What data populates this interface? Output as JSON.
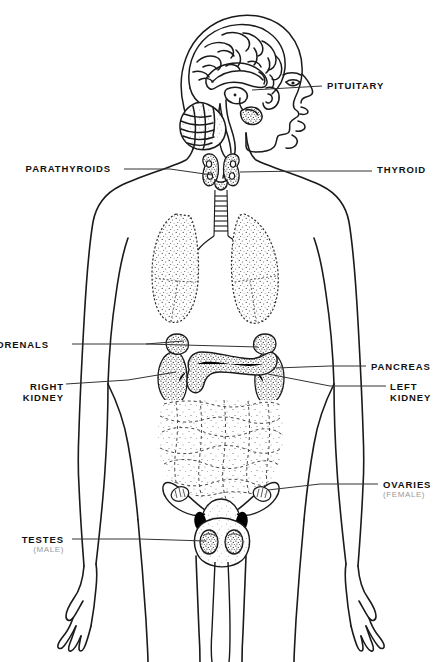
{
  "figure": {
    "title": "Endocrine system anatomical diagram",
    "subject": "human-body-frontal-outline",
    "background_color": "#ffffff",
    "line_color": "#111111",
    "qualifier_color": "#9a9a9a",
    "width": 441,
    "height": 662
  },
  "labels": [
    {
      "id": "pituitary",
      "text": "PITUITARY",
      "qualifier": "",
      "side": "right"
    },
    {
      "id": "thyroid",
      "text": "THYROID",
      "qualifier": "",
      "side": "right"
    },
    {
      "id": "parathyroids",
      "text": "PARATHYROIDS",
      "qualifier": "",
      "side": "left"
    },
    {
      "id": "adrenals",
      "text": "ADRENALS",
      "qualifier": "",
      "side": "left"
    },
    {
      "id": "right_kidney",
      "text": "RIGHT KIDNEY",
      "line1": "RIGHT",
      "line2": "KIDNEY",
      "qualifier": "",
      "side": "left"
    },
    {
      "id": "pancreas",
      "text": "PANCREAS",
      "qualifier": "",
      "side": "right"
    },
    {
      "id": "left_kidney",
      "text": "LEFT KIDNEY",
      "line1": "LEFT",
      "line2": "KIDNEY",
      "qualifier": "",
      "side": "right"
    },
    {
      "id": "ovaries",
      "text": "OVARIES",
      "qualifier": "(FEMALE)",
      "side": "right"
    },
    {
      "id": "testes",
      "text": "TESTES",
      "qualifier": "(MALE)",
      "side": "left"
    }
  ],
  "label_text": {
    "pituitary": "PITUITARY",
    "thyroid": "THYROID",
    "parathyroids": "PARATHYROIDS",
    "adrenals": "ADRENALS",
    "right_kidney_line1": "RIGHT",
    "right_kidney_line2": "KIDNEY",
    "pancreas": "PANCREAS",
    "left_kidney_line1": "LEFT",
    "left_kidney_line2": "KIDNEY",
    "ovaries": "OVARIES",
    "ovaries_qualifier": "(FEMALE)",
    "testes": "TESTES",
    "testes_qualifier": "(MALE)"
  },
  "organs_depicted": [
    "brain-sagittal-section",
    "cerebellum",
    "brainstem",
    "pituitary-gland",
    "thyroid-gland",
    "parathyroid-glands",
    "trachea",
    "lungs",
    "adrenal-glands",
    "kidneys",
    "pancreas",
    "intestines",
    "ovaries",
    "uterus",
    "fallopian-tubes",
    "testes",
    "scrotum"
  ]
}
